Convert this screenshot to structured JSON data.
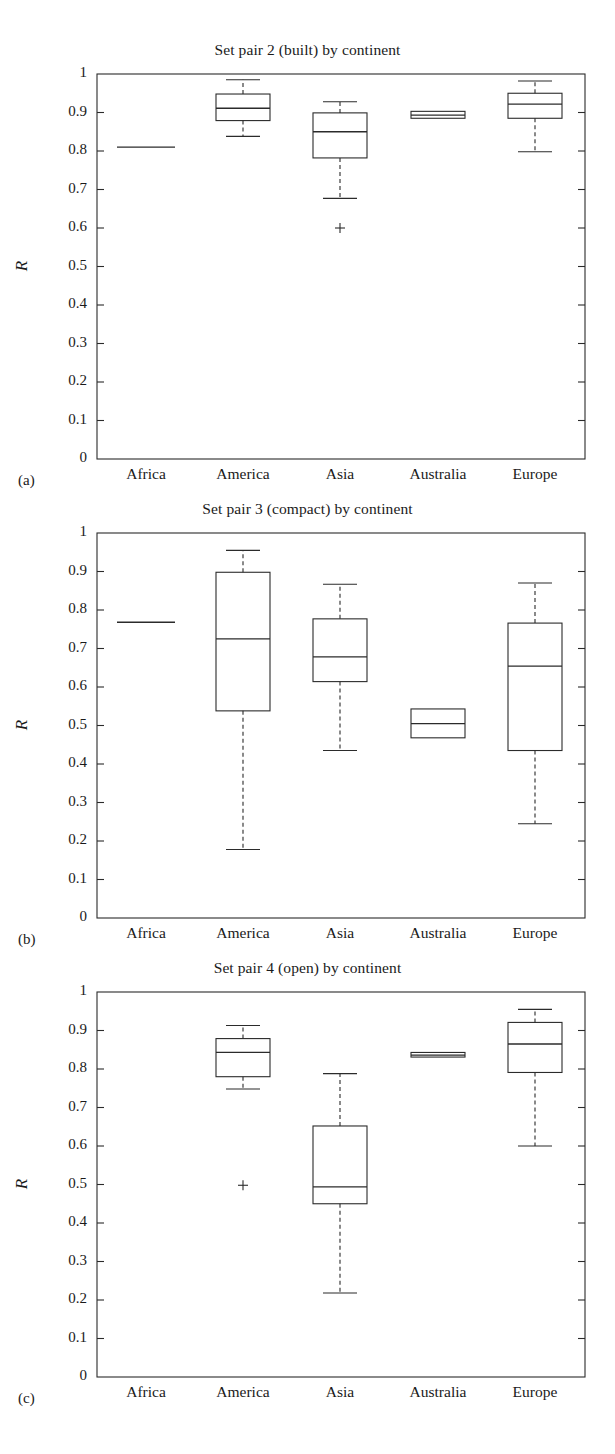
{
  "figure": {
    "y_axis_label": "R",
    "categories": [
      "Africa",
      "America",
      "Asia",
      "Australia",
      "Europe"
    ],
    "y_ticks": [
      "0",
      "0.1",
      "0.2",
      "0.3",
      "0.4",
      "0.5",
      "0.6",
      "0.7",
      "0.8",
      "0.9",
      "1"
    ],
    "panel_letters": [
      "(a)",
      "(b)",
      "(c)"
    ],
    "line_color": "#2b2b2b",
    "background_color": "#ffffff"
  },
  "chart_data": [
    {
      "type": "box",
      "panel": "(a)",
      "title": "Set pair 2 (built) by continent",
      "xlabel": "",
      "ylabel": "R",
      "ylim": [
        0,
        1
      ],
      "yticks": [
        0,
        0.1,
        0.2,
        0.3,
        0.4,
        0.5,
        0.6,
        0.7,
        0.8,
        0.9,
        1
      ],
      "grid": false,
      "categories": [
        "Africa",
        "America",
        "Asia",
        "Australia",
        "Europe"
      ],
      "boxes": [
        {
          "category": "Africa",
          "single_value": 0.81,
          "degenerate": true
        },
        {
          "category": "America",
          "whisker_low": 0.838,
          "q1": 0.879,
          "median": 0.911,
          "q3": 0.948,
          "whisker_high": 0.985,
          "outliers": []
        },
        {
          "category": "Asia",
          "whisker_low": 0.677,
          "q1": 0.782,
          "median": 0.85,
          "q3": 0.899,
          "whisker_high": 0.928,
          "outliers": [
            0.6
          ]
        },
        {
          "category": "Australia",
          "whisker_low": 0.885,
          "q1": 0.885,
          "median": 0.893,
          "q3": 0.903,
          "whisker_high": 0.903,
          "outliers": []
        },
        {
          "category": "Europe",
          "whisker_low": 0.798,
          "q1": 0.885,
          "median": 0.922,
          "q3": 0.95,
          "whisker_high": 0.982,
          "outliers": []
        }
      ]
    },
    {
      "type": "box",
      "panel": "(b)",
      "title": "Set pair 3 (compact) by continent",
      "xlabel": "",
      "ylabel": "R",
      "ylim": [
        0,
        1
      ],
      "yticks": [
        0,
        0.1,
        0.2,
        0.3,
        0.4,
        0.5,
        0.6,
        0.7,
        0.8,
        0.9,
        1
      ],
      "grid": false,
      "categories": [
        "Africa",
        "America",
        "Asia",
        "Australia",
        "Europe"
      ],
      "boxes": [
        {
          "category": "Africa",
          "single_value": 0.768,
          "degenerate": true
        },
        {
          "category": "America",
          "whisker_low": 0.178,
          "q1": 0.538,
          "median": 0.725,
          "q3": 0.898,
          "whisker_high": 0.955,
          "outliers": []
        },
        {
          "category": "Asia",
          "whisker_low": 0.435,
          "q1": 0.614,
          "median": 0.678,
          "q3": 0.777,
          "whisker_high": 0.867,
          "outliers": []
        },
        {
          "category": "Australia",
          "whisker_low": 0.468,
          "q1": 0.468,
          "median": 0.505,
          "q3": 0.543,
          "whisker_high": 0.543,
          "outliers": []
        },
        {
          "category": "Europe",
          "whisker_low": 0.245,
          "q1": 0.435,
          "median": 0.654,
          "q3": 0.766,
          "whisker_high": 0.87,
          "outliers": []
        }
      ]
    },
    {
      "type": "box",
      "panel": "(c)",
      "title": "Set pair 4 (open) by continent",
      "xlabel": "",
      "ylabel": "R",
      "ylim": [
        0,
        1
      ],
      "yticks": [
        0,
        0.1,
        0.2,
        0.3,
        0.4,
        0.5,
        0.6,
        0.7,
        0.8,
        0.9,
        1
      ],
      "grid": false,
      "categories": [
        "Africa",
        "America",
        "Asia",
        "Australia",
        "Europe"
      ],
      "boxes": [
        {
          "category": "Africa",
          "empty": true
        },
        {
          "category": "America",
          "whisker_low": 0.748,
          "q1": 0.78,
          "median": 0.843,
          "q3": 0.879,
          "whisker_high": 0.913,
          "outliers": [
            0.498
          ]
        },
        {
          "category": "Asia",
          "whisker_low": 0.218,
          "q1": 0.45,
          "median": 0.494,
          "q3": 0.652,
          "whisker_high": 0.788,
          "outliers": []
        },
        {
          "category": "Australia",
          "whisker_low": 0.831,
          "q1": 0.831,
          "median": 0.836,
          "q3": 0.843,
          "whisker_high": 0.843,
          "outliers": []
        },
        {
          "category": "Europe",
          "whisker_low": 0.6,
          "q1": 0.791,
          "median": 0.865,
          "q3": 0.921,
          "whisker_high": 0.955,
          "outliers": []
        }
      ]
    }
  ]
}
